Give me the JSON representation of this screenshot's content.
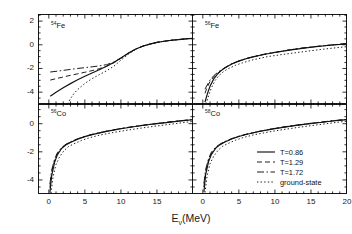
{
  "axes": {
    "ylabel_prefix": "Log",
    "ylabel_sub": "10",
    "ylabel_mid": "[σ",
    "ylabel_sub2": "ν",
    "ylabel_open": " (10",
    "ylabel_sup": "-42",
    "ylabel_units": " cm",
    "ylabel_sup2": "2",
    "ylabel_close": ")]",
    "xlabel_prefix": "E",
    "xlabel_sub": "ν",
    "xlabel_units": "(MeV)",
    "x_ticks_left": [
      "0",
      "5",
      "10",
      "15"
    ],
    "x_ticks_right": [
      "0",
      "5",
      "10",
      "15",
      "20"
    ],
    "y_ticks_top": [
      "2",
      "0",
      "-2",
      "-4"
    ],
    "y_ticks_bottom": [
      "0",
      "-2",
      "-4"
    ],
    "xlim": [
      -1.5,
      20
    ],
    "ylim_top": [
      -5,
      2.6
    ],
    "ylim_bottom": [
      -5,
      1.4
    ]
  },
  "panels": [
    {
      "name": "top-left",
      "mass": "54",
      "element": "Fe"
    },
    {
      "name": "top-right",
      "mass": "56",
      "element": "Fe"
    },
    {
      "name": "bottom-left",
      "mass": "56",
      "element": "Co"
    },
    {
      "name": "bottom-right",
      "mass": "58",
      "element": "Co"
    }
  ],
  "legend": [
    {
      "label": "T=0.86",
      "style": "solid"
    },
    {
      "label": "T=1.29",
      "style": "dashed"
    },
    {
      "label": "T=1.72",
      "style": "dashdot"
    },
    {
      "label": "ground-state",
      "style": "dotted"
    }
  ],
  "chart_data": {
    "type": "line",
    "title": "",
    "xlabel": "E_nu (MeV)",
    "ylabel": "Log10[sigma_nu (10^-42 cm^2)]",
    "grid": false,
    "legend_position": "bottom-right-panel",
    "panels": [
      {
        "label": "54Fe",
        "xlim": [
          -1.5,
          20
        ],
        "ylim": [
          -5,
          2.6
        ],
        "series": [
          {
            "name": "T=0.86",
            "style": "solid",
            "x": [
              0.2,
              1,
              2,
              3,
              4,
              5,
              6,
              7,
              8,
              9,
              10,
              11,
              12,
              13,
              14,
              15,
              16,
              17,
              18,
              19,
              20
            ],
            "y": [
              -4.35,
              -4.0,
              -3.62,
              -3.28,
              -2.96,
              -2.66,
              -2.38,
              -2.1,
              -1.82,
              -1.5,
              -1.12,
              -0.72,
              -0.38,
              -0.12,
              0.06,
              0.2,
              0.3,
              0.38,
              0.44,
              0.5,
              0.55
            ]
          },
          {
            "name": "T=1.29",
            "style": "dashed",
            "x": [
              0.2,
              1,
              2,
              3,
              4,
              5,
              6,
              7,
              8,
              9,
              10,
              11,
              12,
              13,
              14,
              15,
              16,
              17,
              18,
              19,
              20
            ],
            "y": [
              -2.98,
              -2.86,
              -2.72,
              -2.58,
              -2.45,
              -2.32,
              -2.18,
              -2.02,
              -1.82,
              -1.52,
              -1.14,
              -0.74,
              -0.39,
              -0.13,
              0.05,
              0.2,
              0.3,
              0.38,
              0.44,
              0.5,
              0.55
            ]
          },
          {
            "name": "T=1.72",
            "style": "dashdot",
            "x": [
              0.2,
              1,
              2,
              3,
              4,
              5,
              6,
              7,
              8,
              9,
              10,
              11,
              12,
              13,
              14,
              15,
              16,
              17,
              18,
              19,
              20
            ],
            "y": [
              -2.3,
              -2.24,
              -2.16,
              -2.08,
              -2.0,
              -1.93,
              -1.86,
              -1.78,
              -1.68,
              -1.46,
              -1.12,
              -0.73,
              -0.38,
              -0.12,
              0.06,
              0.2,
              0.3,
              0.38,
              0.44,
              0.5,
              0.55
            ]
          },
          {
            "name": "ground-state",
            "style": "dotted",
            "x": [
              2.6,
              3,
              3.5,
              4,
              5,
              6,
              7,
              8,
              9,
              10,
              11,
              12,
              13,
              14,
              15,
              16,
              17,
              18,
              19,
              20
            ],
            "y": [
              -5.0,
              -4.55,
              -4.1,
              -3.78,
              -3.26,
              -2.86,
              -2.52,
              -2.2,
              -1.82,
              -1.3,
              -0.8,
              -0.4,
              -0.12,
              0.07,
              0.2,
              0.3,
              0.38,
              0.44,
              0.5,
              0.55
            ]
          }
        ]
      },
      {
        "label": "56Fe",
        "xlim": [
          -1.5,
          20
        ],
        "ylim": [
          -5,
          2.6
        ],
        "series": [
          {
            "name": "T=0.86",
            "style": "solid",
            "x": [
              0.3,
              0.6,
              1,
              1.5,
              2,
              2.5,
              3,
              4,
              5,
              6,
              7,
              8,
              9,
              10,
              12,
              14,
              16,
              18,
              20
            ],
            "y": [
              -4.85,
              -4.2,
              -3.5,
              -2.9,
              -2.5,
              -2.2,
              -1.98,
              -1.62,
              -1.38,
              -1.18,
              -1.02,
              -0.88,
              -0.76,
              -0.65,
              -0.45,
              -0.28,
              -0.14,
              -0.02,
              0.08
            ]
          },
          {
            "name": "T=1.29",
            "style": "dashed",
            "x": [
              0.3,
              0.6,
              1,
              1.5,
              2,
              2.5,
              3,
              4,
              5,
              6,
              7,
              8,
              9,
              10,
              12,
              14,
              16,
              18,
              20
            ],
            "y": [
              -4.1,
              -3.6,
              -3.1,
              -2.7,
              -2.42,
              -2.18,
              -1.97,
              -1.62,
              -1.37,
              -1.17,
              -1.01,
              -0.87,
              -0.75,
              -0.64,
              -0.44,
              -0.27,
              -0.13,
              -0.01,
              0.09
            ]
          },
          {
            "name": "T=1.72",
            "style": "dashdot",
            "x": [
              0.3,
              0.6,
              1,
              1.5,
              2,
              2.5,
              3,
              4,
              5,
              6,
              7,
              8,
              9,
              10,
              12,
              14,
              16,
              18,
              20
            ],
            "y": [
              -3.75,
              -3.4,
              -2.98,
              -2.62,
              -2.36,
              -2.14,
              -1.95,
              -1.6,
              -1.36,
              -1.16,
              -1.0,
              -0.86,
              -0.74,
              -0.63,
              -0.43,
              -0.26,
              -0.12,
              0.0,
              0.1
            ]
          },
          {
            "name": "ground-state",
            "style": "dotted",
            "x": [
              0.45,
              0.8,
              1.2,
              1.7,
              2.2,
              2.8,
              3.4,
              4.5,
              5.5,
              7,
              9,
              11,
              13,
              15,
              17,
              19,
              20
            ],
            "y": [
              -5.0,
              -4.3,
              -3.62,
              -3.02,
              -2.62,
              -2.3,
              -2.06,
              -1.74,
              -1.52,
              -1.26,
              -1.0,
              -0.82,
              -0.66,
              -0.5,
              -0.35,
              -0.22,
              -0.16
            ]
          }
        ]
      },
      {
        "label": "56Co",
        "xlim": [
          -1.5,
          20
        ],
        "ylim": [
          -5,
          1.4
        ],
        "series": [
          {
            "name": "T=0.86",
            "style": "solid",
            "x": [
              0.15,
              0.4,
              0.8,
              1.2,
              1.8,
              2.4,
              3,
              4,
              5,
              6,
              8,
              10,
              12,
              14,
              16,
              18,
              20
            ],
            "y": [
              -4.9,
              -3.7,
              -2.75,
              -2.2,
              -1.75,
              -1.5,
              -1.33,
              -1.1,
              -0.92,
              -0.78,
              -0.55,
              -0.36,
              -0.2,
              -0.06,
              0.06,
              0.18,
              0.28
            ]
          },
          {
            "name": "T=1.29",
            "style": "dashed",
            "x": [
              0.15,
              0.4,
              0.8,
              1.2,
              1.8,
              2.4,
              3,
              4,
              5,
              6,
              8,
              10,
              12,
              14,
              16,
              18,
              20
            ],
            "y": [
              -4.55,
              -3.45,
              -2.62,
              -2.12,
              -1.72,
              -1.48,
              -1.31,
              -1.09,
              -0.91,
              -0.77,
              -0.54,
              -0.35,
              -0.19,
              -0.05,
              0.07,
              0.19,
              0.29
            ]
          },
          {
            "name": "T=1.72",
            "style": "dashdot",
            "x": [
              0.15,
              0.4,
              0.8,
              1.2,
              1.8,
              2.4,
              3,
              4,
              5,
              6,
              8,
              10,
              12,
              14,
              16,
              18,
              20
            ],
            "y": [
              -4.3,
              -3.3,
              -2.52,
              -2.05,
              -1.68,
              -1.45,
              -1.29,
              -1.07,
              -0.9,
              -0.76,
              -0.53,
              -0.34,
              -0.18,
              -0.04,
              0.08,
              0.2,
              0.3
            ]
          },
          {
            "name": "ground-state",
            "style": "dotted",
            "x": [
              0.3,
              0.6,
              1,
              1.5,
              2.1,
              2.7,
              3.4,
              4.5,
              5.5,
              7,
              9,
              11,
              13,
              15,
              17,
              19,
              20
            ],
            "y": [
              -4.95,
              -3.75,
              -2.9,
              -2.35,
              -1.92,
              -1.64,
              -1.45,
              -1.2,
              -1.02,
              -0.82,
              -0.62,
              -0.45,
              -0.3,
              -0.16,
              -0.03,
              0.1,
              0.16
            ]
          }
        ]
      },
      {
        "label": "58Co",
        "xlim": [
          -1.5,
          20
        ],
        "ylim": [
          -5,
          1.4
        ],
        "series": [
          {
            "name": "T=0.86",
            "style": "solid",
            "x": [
              0.15,
              0.4,
              0.8,
              1.2,
              1.8,
              2.4,
              3,
              4,
              5,
              6,
              8,
              10,
              12,
              14,
              16,
              18,
              20
            ],
            "y": [
              -4.85,
              -3.6,
              -2.7,
              -2.18,
              -1.74,
              -1.49,
              -1.32,
              -1.09,
              -0.91,
              -0.77,
              -0.54,
              -0.35,
              -0.19,
              -0.05,
              0.07,
              0.19,
              0.29
            ]
          },
          {
            "name": "T=1.29",
            "style": "dashed",
            "x": [
              0.15,
              0.4,
              0.8,
              1.2,
              1.8,
              2.4,
              3,
              4,
              5,
              6,
              8,
              10,
              12,
              14,
              16,
              18,
              20
            ],
            "y": [
              -4.5,
              -3.4,
              -2.58,
              -2.1,
              -1.71,
              -1.47,
              -1.3,
              -1.08,
              -0.9,
              -0.76,
              -0.53,
              -0.34,
              -0.18,
              -0.04,
              0.08,
              0.2,
              0.3
            ]
          },
          {
            "name": "T=1.72",
            "style": "dashdot",
            "x": [
              0.15,
              0.4,
              0.8,
              1.2,
              1.8,
              2.4,
              3,
              4,
              5,
              6,
              8,
              10,
              12,
              14,
              16,
              18,
              20
            ],
            "y": [
              -4.25,
              -3.25,
              -2.48,
              -2.02,
              -1.66,
              -1.44,
              -1.28,
              -1.06,
              -0.89,
              -0.75,
              -0.52,
              -0.33,
              -0.17,
              -0.03,
              0.09,
              0.21,
              0.31
            ]
          },
          {
            "name": "ground-state",
            "style": "dotted",
            "x": [
              0.3,
              0.6,
              1,
              1.5,
              2.1,
              2.7,
              3.4,
              4.5,
              5.5,
              7,
              9,
              11,
              13,
              15,
              17,
              19,
              20
            ],
            "y": [
              -4.9,
              -3.7,
              -2.85,
              -2.32,
              -1.9,
              -1.62,
              -1.43,
              -1.18,
              -1.0,
              -0.8,
              -0.6,
              -0.43,
              -0.28,
              -0.14,
              -0.01,
              0.12,
              0.18
            ]
          }
        ]
      }
    ]
  }
}
